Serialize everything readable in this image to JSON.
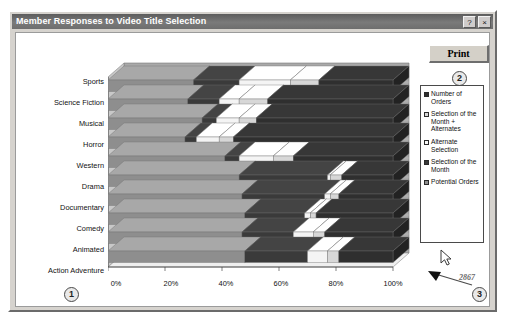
{
  "window": {
    "title": "Member Responses to Video Title Selection",
    "help_button": "?",
    "close_button": "×"
  },
  "toolbar": {
    "print_label": "Print"
  },
  "callouts": [
    {
      "id": "1",
      "label": "1"
    },
    {
      "id": "2",
      "label": "2"
    },
    {
      "id": "3",
      "label": "3"
    }
  ],
  "annotation": {
    "value": "2867",
    "arrow_icon": "arrow-left-icon",
    "cursor_icon": "mouse-pointer-icon"
  },
  "legend": {
    "entries": [
      {
        "label": "Number of Orders",
        "color": "#2f2f2f"
      },
      {
        "label": "Selection of the Month + Alternates",
        "color": "#d7d7d7"
      },
      {
        "label": "Alternate Selection",
        "color": "#f4f4f4"
      },
      {
        "label": "Selection of the Month",
        "color": "#3a3a3a"
      },
      {
        "label": "Potential Orders",
        "color": "#8e8e8e"
      }
    ]
  },
  "chart_data": {
    "type": "bar",
    "orientation": "horizontal",
    "stacked": true,
    "percent_stacked": true,
    "title": "Member Responses to Video Title Selection",
    "xlabel": "",
    "ylabel": "",
    "grid": false,
    "legend_position": "right",
    "xlim": [
      0,
      100
    ],
    "xticks": [
      0,
      20,
      40,
      60,
      80,
      100
    ],
    "xtick_labels": [
      "0%",
      "20%",
      "40%",
      "60%",
      "80%",
      "100%"
    ],
    "categories": [
      "Sports",
      "Science Fiction",
      "Musical",
      "Horror",
      "Western",
      "Drama",
      "Documentary",
      "Comedy",
      "Animated",
      "Action Adventure"
    ],
    "series": [
      {
        "name": "Potential Orders",
        "color": "#8e8e8e",
        "values": [
          30,
          28,
          33,
          27,
          41,
          46,
          47,
          48,
          47,
          48
        ]
      },
      {
        "name": "Selection of the Month",
        "color": "#3a3a3a",
        "values": [
          16,
          11,
          5,
          4,
          5,
          31,
          29,
          21,
          18,
          22
        ]
      },
      {
        "name": "Alternate Selection",
        "color": "#f4f4f4",
        "values": [
          18,
          7,
          8,
          8,
          12,
          1,
          2,
          2,
          7,
          7
        ]
      },
      {
        "name": "Selection of the Month + Alternates",
        "color": "#d7d7d7",
        "values": [
          10,
          10,
          6,
          5,
          7,
          4,
          3,
          2,
          4,
          4
        ]
      },
      {
        "name": "Number of Orders",
        "color": "#2f2f2f",
        "values": [
          26,
          44,
          48,
          56,
          35,
          18,
          19,
          27,
          24,
          19
        ]
      }
    ],
    "annotation_value": "2867"
  }
}
